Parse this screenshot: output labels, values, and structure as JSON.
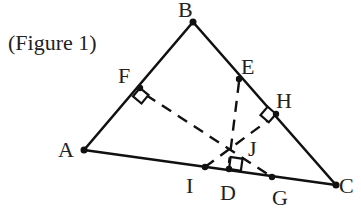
{
  "caption": "(Figure 1)",
  "points": {
    "A": {
      "label": "A",
      "x": 84,
      "y": 150
    },
    "B": {
      "label": "B",
      "x": 193,
      "y": 22
    },
    "C": {
      "label": "C",
      "x": 336,
      "y": 185
    },
    "D": {
      "label": "D",
      "x": 229,
      "y": 169
    },
    "E": {
      "label": "E",
      "x": 239,
      "y": 79
    },
    "F": {
      "label": "F",
      "x": 140,
      "y": 88
    },
    "G": {
      "label": "G",
      "x": 272,
      "y": 177
    },
    "H": {
      "label": "H",
      "x": 276,
      "y": 114
    },
    "I": {
      "label": "I",
      "x": 205,
      "y": 167
    },
    "J": {
      "label": "J",
      "x": 231,
      "y": 148
    }
  },
  "segments": {
    "solid": [
      "AB",
      "BC",
      "CA"
    ],
    "dashed": [
      "FG",
      "ED",
      "IH"
    ]
  },
  "right_angles": [
    "F",
    "H",
    "D"
  ]
}
